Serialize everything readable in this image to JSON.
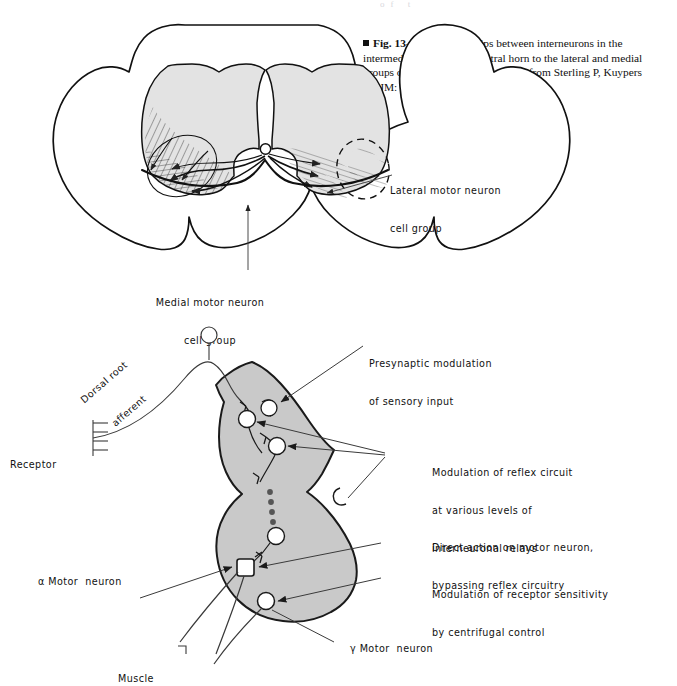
{
  "page": {
    "header_remnant": "of    t",
    "background_color": "#ffffff",
    "ink_color": "#111111",
    "gray_matter_fill_top": "#e3e3e3",
    "gray_matter_fill_bottom": "#c9c9c9",
    "line_color": "#2a2a2a",
    "leader_color": "#3a3a3a"
  },
  "caption": {
    "bullet": "square-bullet",
    "figure_number": "Fig. 13-1",
    "text_part_1": "Relationships between interneurons in the intermediate region and ventral horn to the lateral and medial groups of motor neurons. (Redrawn from Sterling P, Kuypers HGJM: ",
    "journal_italic": "Brain Res",
    "text_part_2": " 7:419, 1968.)"
  },
  "figure_top": {
    "name": "spinal-cord-cross-section",
    "labels": [
      {
        "id": "lateral-motor-neuron-cell-group",
        "line1": "Lateral motor neuron",
        "line2": "cell group"
      },
      {
        "id": "medial-motor-neuron-cell-group",
        "line1": "Medial motor neuron",
        "line2": "cell group"
      }
    ]
  },
  "figure_bottom": {
    "name": "reflex-circuit-half-cord",
    "labels": [
      {
        "id": "dorsal-root-afferent",
        "line1": "Dorsal root",
        "line2": "afferent"
      },
      {
        "id": "receptor",
        "line1": "Receptor"
      },
      {
        "id": "presynaptic-modulation",
        "line1": "Presynaptic modulation",
        "line2": "of sensory input"
      },
      {
        "id": "modulation-of-reflex-circuit",
        "line1": "Modulation of reflex circuit",
        "line2": "at various levels of",
        "line3": "interneuronal relays"
      },
      {
        "id": "direct-action-on-motor-neuron",
        "line1": "Direct action on motor neuron,",
        "line2": "bypassing reflex circuitry"
      },
      {
        "id": "modulation-of-receptor-sensitivity",
        "line1": "Modulation of receptor sensitivity",
        "line2": "by centrifugal control"
      },
      {
        "id": "alpha-motor-neuron",
        "symbol": "α",
        "line1": " Motor  neuron"
      },
      {
        "id": "gamma-motor-neuron",
        "symbol": "γ",
        "line1": " Motor  neuron"
      },
      {
        "id": "muscle",
        "line1": "Muscle"
      }
    ]
  }
}
